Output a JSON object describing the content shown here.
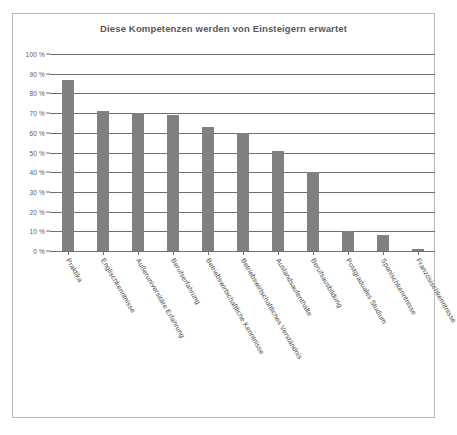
{
  "chart_data": {
    "type": "bar",
    "title": "Diese Kompetenzen werden von Einsteigern erwartet",
    "xlabel": "",
    "ylabel": "",
    "ylim": [
      0,
      100
    ],
    "grid": true,
    "legend": "none",
    "categories": [
      "Praktika",
      "Englischkenntnisse",
      "Außeruniversitäre Erfahrung",
      "Berufserfahrung",
      "Betriebswirtschaftliche Kenntnisse",
      "Betriebswirtschaftliches Verständnis",
      "Auslandsaufenthalte",
      "Berufsausbildung",
      "Postgraduales Studium",
      "Spanischkenntnisse",
      "Französischkenntnisse"
    ],
    "values": [
      87,
      71,
      70,
      69,
      63,
      60,
      51,
      40,
      10,
      8,
      1
    ],
    "ytick_labels": [
      "100 %",
      "90 %",
      "80 %",
      "70 %",
      "60 %",
      "50 %",
      "40 %",
      "30 %",
      "20 %",
      "10 %",
      "0 %"
    ],
    "ytick_values": [
      100,
      90,
      80,
      70,
      60,
      50,
      40,
      30,
      20,
      10,
      0
    ],
    "colors": {
      "bar": "#808080",
      "grid": "#6f6f6f",
      "title_text": "#595959",
      "tick_text": "#5a5a5a",
      "label_text": "#4c4c4c",
      "frame_border": "#b9b9b9",
      "background": "#ffffff"
    }
  }
}
